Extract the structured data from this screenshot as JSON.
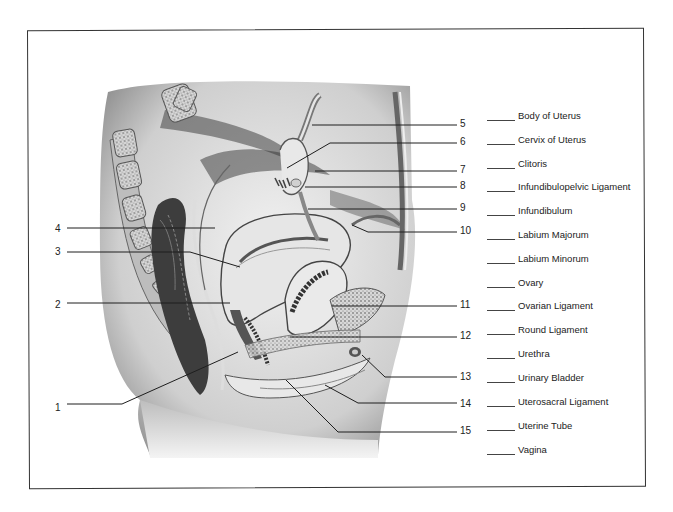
{
  "diagram": {
    "colors": {
      "ink": "#1a1a1a",
      "frame": "#333333",
      "paper": "#ffffff"
    },
    "callouts": [
      {
        "n": "1",
        "x": 55,
        "y": 403,
        "side": "left",
        "line": [
          [
            67,
            404
          ],
          [
            122,
            404
          ],
          [
            238,
            352
          ]
        ]
      },
      {
        "n": "2",
        "x": 55,
        "y": 300,
        "side": "left",
        "line": [
          [
            67,
            303
          ],
          [
            230,
            303
          ]
        ]
      },
      {
        "n": "3",
        "x": 55,
        "y": 247,
        "side": "left",
        "line": [
          [
            67,
            252
          ],
          [
            190,
            252
          ],
          [
            240,
            267
          ]
        ]
      },
      {
        "n": "4",
        "x": 55,
        "y": 224,
        "side": "left",
        "line": [
          [
            67,
            228
          ],
          [
            215,
            228
          ]
        ]
      },
      {
        "n": "5",
        "x": 460,
        "y": 119,
        "side": "right",
        "line": [
          [
            312,
            125
          ],
          [
            457,
            125
          ]
        ]
      },
      {
        "n": "6",
        "x": 460,
        "y": 137,
        "side": "right",
        "line": [
          [
            287,
            168
          ],
          [
            330,
            143
          ],
          [
            457,
            143
          ]
        ]
      },
      {
        "n": "7",
        "x": 460,
        "y": 165,
        "side": "right",
        "line": [
          [
            315,
            171
          ],
          [
            457,
            171
          ]
        ]
      },
      {
        "n": "8",
        "x": 460,
        "y": 181,
        "side": "right",
        "line": [
          [
            305,
            187
          ],
          [
            457,
            187
          ]
        ]
      },
      {
        "n": "9",
        "x": 460,
        "y": 203,
        "side": "right",
        "line": [
          [
            308,
            209
          ],
          [
            457,
            209
          ]
        ]
      },
      {
        "n": "10",
        "x": 460,
        "y": 226,
        "side": "right",
        "line": [
          [
            352,
            225
          ],
          [
            368,
            232
          ],
          [
            457,
            232
          ]
        ]
      },
      {
        "n": "11",
        "x": 460,
        "y": 300,
        "side": "right",
        "line": [
          [
            332,
            306
          ],
          [
            457,
            306
          ]
        ]
      },
      {
        "n": "12",
        "x": 460,
        "y": 331,
        "side": "right",
        "line": [
          [
            290,
            337
          ],
          [
            457,
            337
          ]
        ]
      },
      {
        "n": "13",
        "x": 460,
        "y": 372,
        "side": "right",
        "line": [
          [
            362,
            355
          ],
          [
            385,
            377
          ],
          [
            457,
            377
          ]
        ]
      },
      {
        "n": "14",
        "x": 460,
        "y": 399,
        "side": "right",
        "line": [
          [
            325,
            385
          ],
          [
            358,
            403
          ],
          [
            457,
            403
          ]
        ]
      },
      {
        "n": "15",
        "x": 460,
        "y": 426,
        "side": "right",
        "line": [
          [
            286,
            380
          ],
          [
            338,
            432
          ],
          [
            457,
            432
          ]
        ]
      }
    ]
  },
  "word_bank": {
    "items": [
      {
        "label": "Body of Uterus",
        "y": 110
      },
      {
        "label": "Cervix of Uterus",
        "y": 134
      },
      {
        "label": "Clitoris",
        "y": 158
      },
      {
        "label": "Infundibulopelvic Ligament",
        "y": 181
      },
      {
        "label": "Infundibulum",
        "y": 205
      },
      {
        "label": "Labium Majorum",
        "y": 229
      },
      {
        "label": "Labium Minorum",
        "y": 253
      },
      {
        "label": "Ovary",
        "y": 277
      },
      {
        "label": "Ovarian Ligament",
        "y": 300
      },
      {
        "label": "Round Ligament",
        "y": 324
      },
      {
        "label": "Urethra",
        "y": 348
      },
      {
        "label": "Urinary Bladder",
        "y": 372
      },
      {
        "label": "Uterosacral Ligament",
        "y": 396
      },
      {
        "label": "Uterine Tube",
        "y": 420
      },
      {
        "label": "Vagina",
        "y": 444
      }
    ]
  }
}
